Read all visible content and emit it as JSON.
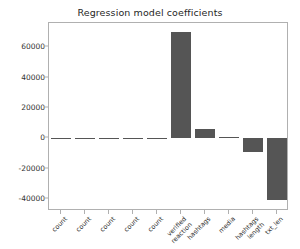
{
  "chart_data": {
    "type": "bar",
    "title": "Regression model coefficients",
    "xlabel": "",
    "ylabel": "",
    "categories": [
      "count",
      "count",
      "count",
      "count",
      "count",
      "verified\nreaction",
      "hashtags",
      "media",
      "hashtags\nlength",
      "txt_len"
    ],
    "values": [
      0,
      0,
      0,
      0,
      0,
      70000,
      5800,
      900,
      -9000,
      -41000
    ],
    "ylim": [
      -48000,
      76000
    ],
    "yticks": [
      60000,
      40000,
      20000,
      0,
      -20000,
      -40000
    ],
    "ytick_labels": [
      "60000",
      "40000",
      "20000",
      "0",
      "-20000",
      "-40000"
    ],
    "grid": false,
    "legend": "none",
    "bar_color": "#555555",
    "axes_color": "#b0b0b0",
    "text_color": "#303030",
    "background": "#ffffff"
  }
}
